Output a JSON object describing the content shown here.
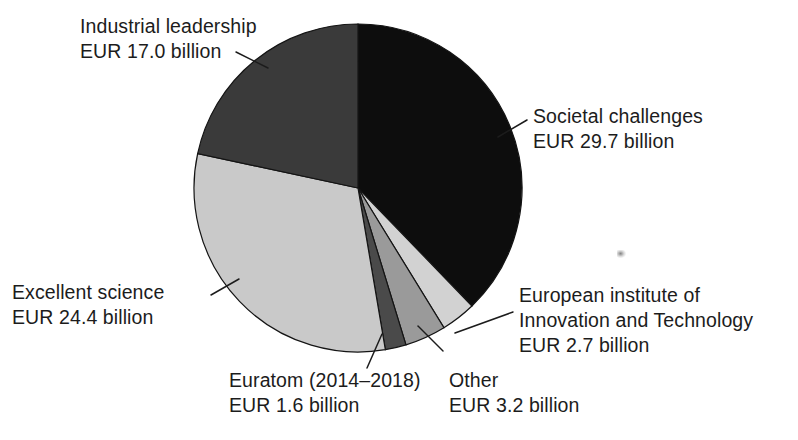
{
  "figure": {
    "name": "horizon-2020-budget-pie",
    "background_color": "#ffffff"
  },
  "chart_data": {
    "type": "pie",
    "title": "",
    "subtitle": "",
    "xlabel": "",
    "ylabel": "",
    "units": "EUR billion",
    "total": 78.6,
    "legend_position": "callout-labels",
    "grid": false,
    "start_angle_deg": 0,
    "direction": "clockwise",
    "categories": [
      "Societal challenges",
      "European institute of Innovation and Technology",
      "Other",
      "Euratom (2014–2018)",
      "Excellent science",
      "Industrial leadership"
    ],
    "values": [
      29.7,
      2.7,
      3.2,
      1.6,
      24.4,
      17.0
    ],
    "colors": [
      "#0d0d0d",
      "#d2d2d2",
      "#9a9a9a",
      "#4a4a4a",
      "#c9c9c9",
      "#3a3a3a"
    ],
    "slices": [
      {
        "id": "societal-challenges",
        "label": "Societal challenges",
        "value_label": "EUR 29.7 billion",
        "value": 29.7,
        "color": "#0d0d0d",
        "start_deg": 0.0,
        "end_deg": 136.0
      },
      {
        "id": "eit",
        "label": "European institute of Innovation and Technology",
        "label_line1": "European institute of",
        "label_line2": "Innovation and Technology",
        "value_label": "EUR 2.7 billion",
        "value": 2.7,
        "color": "#d2d2d2",
        "start_deg": 136.0,
        "end_deg": 148.4
      },
      {
        "id": "other",
        "label": "Other",
        "value_label": "EUR 3.2 billion",
        "value": 3.2,
        "color": "#9a9a9a",
        "start_deg": 148.4,
        "end_deg": 163.0
      },
      {
        "id": "euratom",
        "label": "Euratom (2014–2018)",
        "value_label": "EUR 1.6 billion",
        "value": 1.6,
        "color": "#4a4a4a",
        "start_deg": 163.0,
        "end_deg": 170.4
      },
      {
        "id": "excellent-science",
        "label": "Excellent science",
        "value_label": "EUR 24.4 billion",
        "value": 24.4,
        "color": "#c9c9c9",
        "start_deg": 170.4,
        "end_deg": 282.1
      },
      {
        "id": "industrial-leadership",
        "label": "Industrial leadership",
        "value_label": "EUR 17.0 billion",
        "value": 17.0,
        "color": "#3a3a3a",
        "start_deg": 282.1,
        "end_deg": 360.0
      }
    ]
  },
  "labels": {
    "industrial_leadership": {
      "line1": "Industrial leadership",
      "line2": "EUR 17.0 billion"
    },
    "societal_challenges": {
      "line1": "Societal challenges",
      "line2": "EUR 29.7 billion"
    },
    "excellent_science": {
      "line1": "Excellent science",
      "line2": "EUR 24.4 billion"
    },
    "eit": {
      "line1": "European institute of",
      "line2": "Innovation and Technology",
      "line3": "EUR 2.7 billion"
    },
    "euratom": {
      "line1": "Euratom (2014–2018)",
      "line2": "EUR 1.6 billion"
    },
    "other": {
      "line1": "Other",
      "line2": "EUR 3.2 billion"
    }
  }
}
